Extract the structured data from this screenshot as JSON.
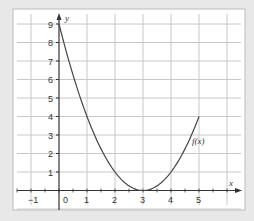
{
  "chart_data": {
    "type": "line",
    "title": "",
    "xlabel": "x",
    "ylabel": "y",
    "xlim": [
      -1.6,
      6.5
    ],
    "ylim": [
      -1,
      9.6
    ],
    "grid": true,
    "x_ticks": [
      -1,
      0,
      1,
      2,
      3,
      4,
      5
    ],
    "x_tick_labels": [
      "−1",
      "0",
      "1",
      "2",
      "3",
      "4",
      "5"
    ],
    "y_ticks": [
      1,
      2,
      3,
      4,
      5,
      6,
      7,
      8,
      9
    ],
    "y_tick_labels": [
      "1",
      "2",
      "3",
      "4",
      "5",
      "6",
      "7",
      "8",
      "9"
    ],
    "series": [
      {
        "name": "f(x)",
        "label": "f(x)",
        "equation": "(x-3)^2",
        "x": [
          0,
          0.5,
          1,
          1.5,
          2,
          2.5,
          3,
          3.5,
          4,
          4.5,
          5
        ],
        "values": [
          9,
          6.25,
          4,
          2.25,
          1,
          0.25,
          0,
          0.25,
          1,
          2.25,
          4
        ],
        "color": "#444444"
      }
    ]
  },
  "colors": {
    "background": "#e8e8e8",
    "plot_bg": "#ffffff",
    "grid": "#c8c8c8",
    "axis": "#333333",
    "curve": "#444444"
  }
}
